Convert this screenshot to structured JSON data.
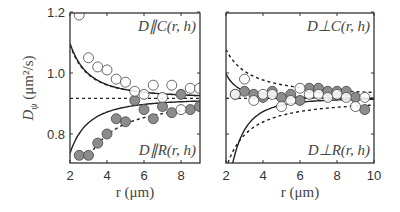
{
  "chart_data": [
    {
      "type": "scatter",
      "panel": "left",
      "xlabel": "r (μm)",
      "ylabel": "D_ψ (μm²/s)",
      "xlim": [
        2,
        9.6
      ],
      "ylim": [
        0.7,
        1.22
      ],
      "xticks": [
        2,
        4,
        6,
        8
      ],
      "yticks": [
        0.8,
        1.0,
        1.2
      ],
      "annotations": [
        "D∥C(r,h)",
        "D∥R(r,h)"
      ],
      "series": [
        {
          "name": "D∥C data (open circles)",
          "x": [
            2.5,
            3.0,
            3.5,
            4.0,
            4.5,
            5.0,
            5.5,
            6.0,
            6.5,
            7.0,
            7.5,
            8.0,
            8.5,
            9.0,
            9.5
          ],
          "y": [
            1.19,
            1.05,
            1.02,
            1.01,
            0.98,
            0.97,
            0.94,
            0.93,
            0.96,
            0.92,
            0.96,
            0.88,
            0.95,
            0.95,
            0.93
          ]
        },
        {
          "name": "D∥R data (filled circles)",
          "x": [
            2.5,
            3.0,
            3.5,
            4.0,
            4.5,
            5.0,
            5.5,
            6.0,
            6.5,
            7.0,
            7.5,
            8.0,
            8.5,
            9.0,
            9.5
          ],
          "y": [
            0.73,
            0.73,
            0.77,
            0.8,
            0.85,
            0.84,
            0.91,
            0.88,
            0.85,
            0.89,
            0.87,
            0.93,
            0.88,
            0.89,
            0.9
          ]
        },
        {
          "name": "D∥C theory (solid)",
          "style": "solid"
        },
        {
          "name": "D∥R theory (solid)",
          "style": "solid"
        },
        {
          "name": "bounds (dashed)",
          "style": "dashed"
        },
        {
          "name": "bulk value (dashed horizontal)",
          "y": 0.917,
          "style": "dashed"
        }
      ]
    },
    {
      "type": "scatter",
      "panel": "right",
      "xlabel": "r (μm)",
      "xlim": [
        2,
        10
      ],
      "ylim": [
        0.7,
        1.22
      ],
      "xticks": [
        2,
        4,
        6,
        8,
        10
      ],
      "annotations": [
        "D⊥C(r,h)",
        "D⊥R(r,h)"
      ],
      "series": [
        {
          "name": "D⊥C data (open circles)",
          "x": [
            2.5,
            3.0,
            3.5,
            4.0,
            4.5,
            5.0,
            5.5,
            6.0,
            6.5,
            7.0,
            7.5,
            8.0,
            8.5,
            9.0,
            9.5
          ],
          "y": [
            0.93,
            0.98,
            0.91,
            0.93,
            0.93,
            0.89,
            0.91,
            0.95,
            0.93,
            0.93,
            0.92,
            0.93,
            0.92,
            0.89,
            0.92
          ]
        },
        {
          "name": "D⊥R data (filled circles)",
          "x": [
            2.5,
            3.0,
            3.5,
            4.0,
            4.5,
            5.0,
            5.5,
            6.0,
            6.5,
            7.0,
            7.5,
            8.0,
            8.5,
            9.0,
            9.5
          ],
          "y": [
            0.93,
            0.94,
            0.93,
            0.92,
            0.94,
            0.92,
            0.93,
            0.91,
            0.95,
            0.95,
            0.94,
            0.94,
            0.94,
            0.92,
            0.88
          ]
        },
        {
          "name": "bulk value (dashed horizontal)",
          "y": 0.917,
          "style": "dashed"
        }
      ]
    }
  ],
  "labels": {
    "ylabel_main": "D",
    "ylabel_sub": "ψ",
    "ylabel_units": "(μm²/s)",
    "xlabel_left": "r (μm)",
    "xlabel_right": "r (μm)",
    "left_top": "D∥C(r, h)",
    "left_bottom": "D∥R(r, h)",
    "right_top": "D⊥C(r, h)",
    "right_bottom": "D⊥R(r, h)"
  },
  "colors": {
    "open": "#ffffff",
    "filled": "#8c8c8c",
    "stroke": "#444444",
    "axis": "#333333"
  }
}
